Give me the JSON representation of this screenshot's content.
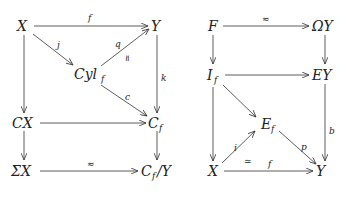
{
  "diagrams": [
    {
      "name": "cofiber-diagram",
      "nodes": {
        "X": "X",
        "Y": "Y",
        "Cyl": "Cyl",
        "Cyl_sub": "f",
        "CX": "CX",
        "C": "C",
        "C_sub": "f",
        "SX": "ΣX",
        "CY": "C",
        "CY_sub": "f",
        "CY_tail": "/Y"
      },
      "edges": [
        {
          "from": "X",
          "to": "Y",
          "label": "f"
        },
        {
          "from": "X",
          "to": "Cyl_f",
          "label": "j"
        },
        {
          "from": "Cyl_f",
          "to": "Y",
          "label": "q",
          "extra": "≃"
        },
        {
          "from": "Y",
          "to": "C_f",
          "label": "k"
        },
        {
          "from": "Cyl_f",
          "to": "C_f",
          "label": "c"
        },
        {
          "from": "X",
          "to": "CX",
          "label": ""
        },
        {
          "from": "CX",
          "to": "C_f",
          "label": ""
        },
        {
          "from": "CX",
          "to": "ΣX",
          "label": ""
        },
        {
          "from": "C_f",
          "to": "C_f/Y",
          "label": ""
        },
        {
          "from": "ΣX",
          "to": "C_f/Y",
          "label": "≈"
        }
      ]
    },
    {
      "name": "fiber-diagram",
      "nodes": {
        "F": "F",
        "OY": "ΩY",
        "I": "I",
        "I_sub": "f",
        "EY": "EY",
        "E": "E",
        "E_sub": "f",
        "X": "X",
        "Y": "Y"
      },
      "edges": [
        {
          "from": "F",
          "to": "ΩY",
          "label": "≈"
        },
        {
          "from": "F",
          "to": "I_f",
          "label": ""
        },
        {
          "from": "ΩY",
          "to": "EY",
          "label": ""
        },
        {
          "from": "I_f",
          "to": "EY",
          "label": ""
        },
        {
          "from": "I_f",
          "to": "E_f",
          "label": ""
        },
        {
          "from": "I_f",
          "to": "X",
          "label": ""
        },
        {
          "from": "EY",
          "to": "Y",
          "label": "b"
        },
        {
          "from": "X",
          "to": "E_f",
          "label": "i",
          "extra": "≃"
        },
        {
          "from": "E_f",
          "to": "Y",
          "label": "p"
        },
        {
          "from": "X",
          "to": "Y",
          "label": "f"
        }
      ]
    }
  ]
}
